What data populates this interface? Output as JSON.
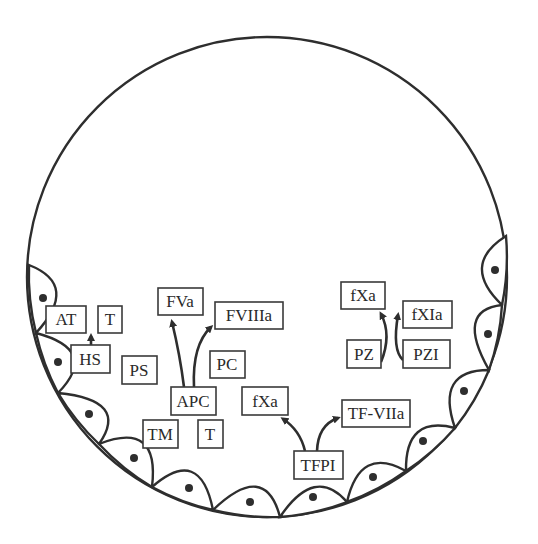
{
  "diagram": {
    "type": "blood-vessel-cross-section",
    "colors": {
      "stroke": "#2e2e2e",
      "background": "#ffffff"
    },
    "vessel": {
      "cx": 267,
      "cy": 277,
      "r": 240
    },
    "labels": {
      "at": "AT",
      "t_top": "T",
      "hs": "HS",
      "ps": "PS",
      "fva": "FVa",
      "fviiia": "FVIIIa",
      "pc": "PC",
      "apc": "APC",
      "tm": "TM",
      "t_bottom": "T",
      "fxa_mid": "fXa",
      "tf_viia": "TF-VIIa",
      "tfpi": "TFPI",
      "fxa_top": "fXa",
      "fxia": "fXIa",
      "pz": "PZ",
      "pzi": "PZI"
    },
    "relations": [
      {
        "from": "HS",
        "to": "AT/T",
        "type": "arrow"
      },
      {
        "from": "APC",
        "to": "FVa",
        "type": "arrow"
      },
      {
        "from": "APC",
        "to": "FVIIIa",
        "type": "arrow"
      },
      {
        "from": "TFPI",
        "to": "fXa",
        "type": "arrow"
      },
      {
        "from": "TFPI",
        "to": "TF-VIIa",
        "type": "arrow"
      },
      {
        "from": "PZ",
        "to": "fXa",
        "type": "arrow"
      },
      {
        "from": "PZI",
        "to": "fXIa",
        "type": "arrow"
      }
    ],
    "endothelial_cell_count": 12
  }
}
